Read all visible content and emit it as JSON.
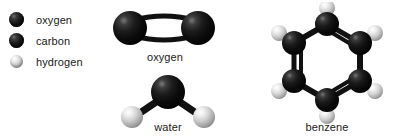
{
  "figure": {
    "background_color": "#ffffff",
    "title": ""
  },
  "legend": {
    "items": [
      {
        "label": "oxygen",
        "atom": "O",
        "color": "#0d0d0d",
        "swatch_size_px": 15,
        "icon": "sphere-icon"
      },
      {
        "label": "carbon",
        "atom": "C",
        "color": "#0d0d0d",
        "swatch_size_px": 15,
        "icon": "sphere-icon"
      },
      {
        "label": "hydrogen",
        "atom": "H",
        "color": "#cfcfcf",
        "swatch_size_px": 13,
        "icon": "sphere-icon"
      }
    ]
  },
  "molecules": [
    {
      "id": "oxygen",
      "label": "oxygen",
      "formula": "O2",
      "bond_order": 2,
      "atoms": [
        {
          "element": "O",
          "x": 20,
          "y": 26,
          "r": 17
        },
        {
          "element": "O",
          "x": 88,
          "y": 26,
          "r": 17
        }
      ],
      "bonds": [
        {
          "from": 0,
          "to": 1,
          "order": 2,
          "style": "double-curved"
        }
      ]
    },
    {
      "id": "water",
      "label": "water",
      "formula": "H2O",
      "bond_angle_deg": 104,
      "atoms": [
        {
          "element": "O",
          "x": 50,
          "y": 20,
          "r": 17
        },
        {
          "element": "H",
          "x": 14,
          "y": 45,
          "r": 11
        },
        {
          "element": "H",
          "x": 86,
          "y": 45,
          "r": 11
        }
      ],
      "bonds": [
        {
          "from": 0,
          "to": 1,
          "order": 1,
          "style": "single"
        },
        {
          "from": 0,
          "to": 2,
          "order": 1,
          "style": "single"
        }
      ]
    },
    {
      "id": "benzene",
      "label": "benzene",
      "formula": "C6H6",
      "ring": "hexagon",
      "atoms": [
        {
          "element": "C",
          "x": 65,
          "y": 22,
          "r": 12
        },
        {
          "element": "C",
          "x": 98,
          "y": 41,
          "r": 12
        },
        {
          "element": "C",
          "x": 98,
          "y": 79,
          "r": 12
        },
        {
          "element": "C",
          "x": 65,
          "y": 98,
          "r": 12
        },
        {
          "element": "C",
          "x": 32,
          "y": 79,
          "r": 12
        },
        {
          "element": "C",
          "x": 32,
          "y": 41,
          "r": 12
        },
        {
          "element": "H",
          "x": 65,
          "y": 6,
          "r": 8
        },
        {
          "element": "H",
          "x": 112,
          "y": 32,
          "r": 8
        },
        {
          "element": "H",
          "x": 112,
          "y": 88,
          "r": 8
        },
        {
          "element": "H",
          "x": 65,
          "y": 114,
          "r": 8
        },
        {
          "element": "H",
          "x": 18,
          "y": 88,
          "r": 8
        },
        {
          "element": "H",
          "x": 18,
          "y": 32,
          "r": 8
        }
      ],
      "bonds": [
        {
          "from": 0,
          "to": 1,
          "order": 2
        },
        {
          "from": 1,
          "to": 2,
          "order": 1
        },
        {
          "from": 2,
          "to": 3,
          "order": 2
        },
        {
          "from": 3,
          "to": 4,
          "order": 1
        },
        {
          "from": 4,
          "to": 5,
          "order": 2
        },
        {
          "from": 5,
          "to": 0,
          "order": 1
        },
        {
          "from": 0,
          "to": 6,
          "order": 1
        },
        {
          "from": 1,
          "to": 7,
          "order": 1
        },
        {
          "from": 2,
          "to": 8,
          "order": 1
        },
        {
          "from": 3,
          "to": 9,
          "order": 1
        },
        {
          "from": 4,
          "to": 10,
          "order": 1
        },
        {
          "from": 5,
          "to": 11,
          "order": 1
        }
      ]
    }
  ]
}
